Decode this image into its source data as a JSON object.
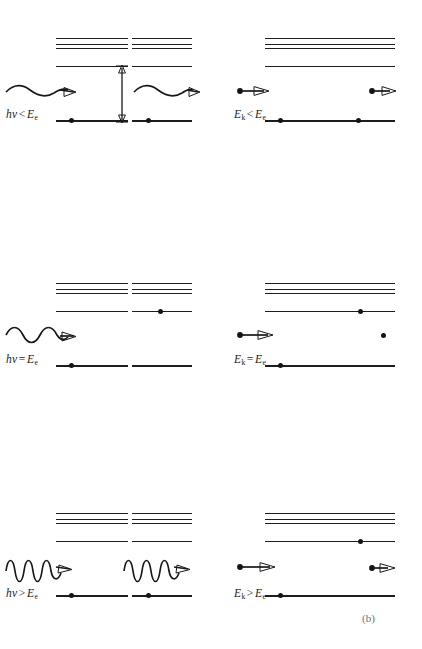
{
  "figure": {
    "caption": "(b)",
    "colors": {
      "ink": "#1a1a1a",
      "line": "#1d1d1d",
      "dot": "#141414"
    }
  },
  "axis_annotation": {
    "name": "energy-gap-arrow",
    "description": "double headed vertical arrow marking E_e gap between ground level and first excited level"
  },
  "columns": [
    {
      "id": "photon",
      "agent": "photon",
      "arrow_style": "wavy"
    },
    {
      "id": "electron",
      "agent": "electron",
      "arrow_style": "straight"
    }
  ],
  "states": [
    {
      "id": "before",
      "label": "before"
    },
    {
      "id": "after",
      "label": "after"
    }
  ],
  "rows": [
    {
      "id": "less-than",
      "photon": {
        "label_html": "hν < E_e",
        "label_lhs": "h",
        "label_nu": "ν",
        "relation": "<",
        "label_rhs": "E",
        "label_sub": "e",
        "before": {
          "wave_cycles": 1.5,
          "electron_level": "ground"
        },
        "after": {
          "wave_cycles": 1.5,
          "electron_level": "ground",
          "outcome": "photon scattered unchanged"
        }
      },
      "electron": {
        "label_html": "E_k < E_e",
        "label_lhs": "E",
        "label_lhs_sub": "k",
        "relation": "<",
        "label_rhs": "E",
        "label_sub": "e",
        "before": {
          "arrow_length": "long",
          "electron_level": "ground"
        },
        "after": {
          "arrow_length": "long",
          "electron_level": "ground",
          "outcome": "electron scattered elastically"
        }
      }
    },
    {
      "id": "equal-to",
      "photon": {
        "label_html": "hν = E_e",
        "label_lhs": "h",
        "label_nu": "ν",
        "relation": "=",
        "label_rhs": "E",
        "label_sub": "e",
        "before": {
          "wave_cycles": 2,
          "electron_level": "ground"
        },
        "after": {
          "wave_cycles": 0,
          "electron_level": "excited",
          "outcome": "photon absorbed, atom excited"
        }
      },
      "electron": {
        "label_html": "E_k = E_e",
        "label_lhs": "E",
        "label_lhs_sub": "k",
        "relation": "=",
        "label_rhs": "E",
        "label_sub": "e",
        "before": {
          "arrow_length": "long",
          "electron_level": "ground"
        },
        "after": {
          "arrow_length": "none",
          "electron_level": "excited",
          "outcome": "electron stopped, atom excited"
        }
      }
    },
    {
      "id": "greater-than",
      "photon": {
        "label_html": "hν > E_e",
        "label_lhs": "h",
        "label_nu": "ν",
        "relation": ">",
        "label_rhs": "E",
        "label_sub": "e",
        "before": {
          "wave_cycles": 4,
          "electron_level": "ground"
        },
        "after": {
          "wave_cycles": 4,
          "electron_level": "ground",
          "outcome": "photon not absorbed"
        }
      },
      "electron": {
        "label_html": "E_k > E_e",
        "label_lhs": "E",
        "label_lhs_sub": "k",
        "relation": ">",
        "label_rhs": "E",
        "label_sub": "e",
        "before": {
          "arrow_length": "long",
          "electron_level": "ground"
        },
        "after": {
          "arrow_length": "short",
          "electron_level": "excited",
          "outcome": "electron loses E_e, atom excited"
        }
      }
    }
  ]
}
